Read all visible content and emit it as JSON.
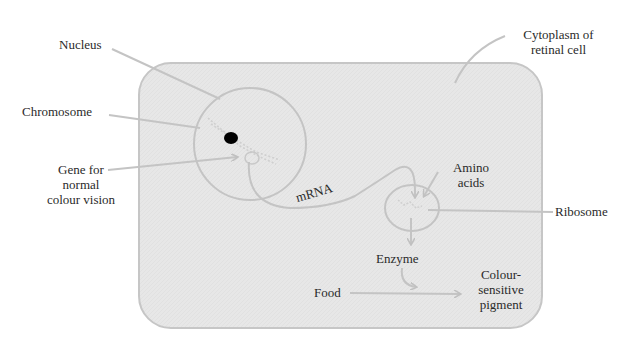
{
  "diagram": {
    "type": "biology-cell-process",
    "colors": {
      "cytoplasm_fill": "#e6e6e6",
      "outline": "#c2c2c2",
      "arrow": "#c4c4c4",
      "chromosome_dot": "#000000",
      "text": "#2a2a2a"
    },
    "labels": {
      "nucleus": "Nucleus",
      "cytoplasm_line1": "Cytoplasm of",
      "cytoplasm_line2": "retinal cell",
      "chromosome": "Chromosome",
      "gene_line1": "Gene for",
      "gene_line2": "normal",
      "gene_line3": "colour vision",
      "mrna": "mRNA",
      "amino_line1": "Amino",
      "amino_line2": "acids",
      "ribosome": "Ribosome",
      "enzyme": "Enzyme",
      "food": "Food",
      "pigment_line1": "Colour-",
      "pigment_line2": "sensitive",
      "pigment_line3": "pigment"
    },
    "flow": [
      {
        "from": "Gene for normal colour vision",
        "to": "mRNA"
      },
      {
        "from": "mRNA",
        "to": "Ribosome"
      },
      {
        "from": "Amino acids",
        "to": "Ribosome"
      },
      {
        "from": "Ribosome",
        "to": "Enzyme"
      },
      {
        "from": "Food",
        "to": "Colour-sensitive pigment",
        "catalyst": "Enzyme"
      }
    ]
  }
}
